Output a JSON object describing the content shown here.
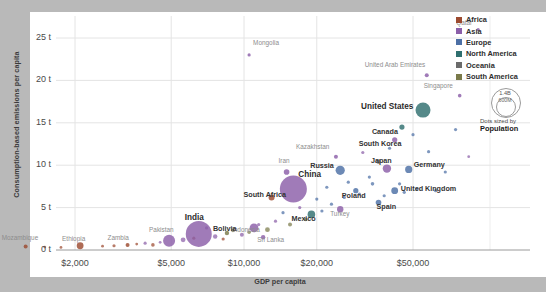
{
  "chart_data": {
    "type": "scatter",
    "title": "",
    "xlabel": "GDP per capita",
    "ylabel": "Consumption-based emissions per capita",
    "xscale": "log",
    "xticks": [
      "$2,000",
      "$5,000",
      "$10,000",
      "$20,000",
      "$50,000"
    ],
    "xtick_values": [
      2000,
      5000,
      10000,
      20000,
      50000
    ],
    "yticks": [
      "0 t",
      "5 t",
      "10 t",
      "15 t",
      "20 t",
      "25 t"
    ],
    "ytick_values": [
      0,
      5,
      10,
      15,
      20,
      25
    ],
    "ylim": [
      0,
      27
    ],
    "grid": true,
    "legend_position": "top-right",
    "size_encoding": "Population",
    "points": [
      {
        "name": "Qatar",
        "x": 93000,
        "y": 26.0,
        "region": "Asia",
        "r": 1.6,
        "label": true,
        "dim": true
      },
      {
        "name": "Mongolia",
        "x": 10500,
        "y": 23.0,
        "region": "Asia",
        "r": 1.6,
        "label": true,
        "dim": true
      },
      {
        "name": "United Arab Emirates",
        "x": 57000,
        "y": 20.6,
        "region": "Asia",
        "r": 2.0,
        "label": true,
        "dim": true
      },
      {
        "name": "Singapore",
        "x": 78000,
        "y": 18.2,
        "region": "Asia",
        "r": 1.8,
        "label": true,
        "dim": true
      },
      {
        "name": "United States",
        "x": 55000,
        "y": 16.5,
        "region": "North America",
        "r": 7.5,
        "label": true,
        "big": true
      },
      {
        "name": "Canada",
        "x": 45000,
        "y": 14.5,
        "region": "North America",
        "r": 2.6,
        "label": true,
        "med": true
      },
      {
        "name": "South Korea",
        "x": 42000,
        "y": 13.0,
        "region": "Asia",
        "r": 2.6,
        "label": true,
        "med": true
      },
      {
        "name": "Kazakhstan",
        "x": 24000,
        "y": 11.0,
        "region": "Asia",
        "r": 2.0,
        "label": true,
        "dim": true
      },
      {
        "name": "Russia",
        "x": 25000,
        "y": 9.4,
        "region": "Europe",
        "r": 4.6,
        "label": true,
        "med": true
      },
      {
        "name": "Japan",
        "x": 39000,
        "y": 9.6,
        "region": "Asia",
        "r": 4.2,
        "label": true,
        "med": true
      },
      {
        "name": "Germany",
        "x": 48000,
        "y": 9.5,
        "region": "Europe",
        "r": 3.6,
        "label": true,
        "med": true
      },
      {
        "name": "Iran",
        "x": 15000,
        "y": 9.2,
        "region": "Asia",
        "r": 2.8,
        "label": true,
        "dim": true
      },
      {
        "name": "China",
        "x": 16000,
        "y": 7.2,
        "region": "Asia",
        "r": 13.5,
        "label": true,
        "big": true
      },
      {
        "name": "Poland",
        "x": 29000,
        "y": 7.0,
        "region": "Europe",
        "r": 2.6,
        "label": true,
        "med": true
      },
      {
        "name": "United Kingdom",
        "x": 42000,
        "y": 7.0,
        "region": "Europe",
        "r": 3.4,
        "label": true,
        "med": true
      },
      {
        "name": "South Africa",
        "x": 13000,
        "y": 6.2,
        "region": "Africa",
        "r": 3.0,
        "label": true,
        "med": true
      },
      {
        "name": "Spain",
        "x": 36000,
        "y": 5.6,
        "region": "Europe",
        "r": 2.8,
        "label": true,
        "med": true
      },
      {
        "name": "Turkey",
        "x": 25000,
        "y": 4.8,
        "region": "Asia",
        "r": 3.2,
        "label": true,
        "dim": true
      },
      {
        "name": "Mexico",
        "x": 19000,
        "y": 4.2,
        "region": "North America",
        "r": 3.8,
        "label": true,
        "med": true
      },
      {
        "name": "Indonesia",
        "x": 11000,
        "y": 2.6,
        "region": "Asia",
        "r": 4.4,
        "label": true,
        "dim": true
      },
      {
        "name": "India",
        "x": 6500,
        "y": 1.9,
        "region": "Asia",
        "r": 13.0,
        "label": true,
        "big": true
      },
      {
        "name": "Bolivia",
        "x": 8500,
        "y": 2.0,
        "region": "South America",
        "r": 2.2,
        "label": true,
        "med": true
      },
      {
        "name": "Sri Lanka",
        "x": 12000,
        "y": 1.5,
        "region": "Asia",
        "r": 2.2,
        "label": true,
        "dim": true
      },
      {
        "name": "Pakistan",
        "x": 4900,
        "y": 1.1,
        "region": "Asia",
        "r": 6.0,
        "label": true,
        "dim": true
      },
      {
        "name": "Zambia",
        "x": 3300,
        "y": 0.6,
        "region": "Africa",
        "r": 2.0,
        "label": true,
        "dim": true
      },
      {
        "name": "Ethiopia",
        "x": 2100,
        "y": 0.5,
        "region": "Africa",
        "r": 3.4,
        "label": true,
        "dim": true
      },
      {
        "name": "Mozambique",
        "x": 1250,
        "y": 0.4,
        "region": "Africa",
        "r": 2.0,
        "label": true,
        "dim": true
      }
    ],
    "unlabeled_points": [
      {
        "x": 1500,
        "y": 0.35,
        "region": "Africa",
        "r": 1.4
      },
      {
        "x": 1750,
        "y": 0.3,
        "region": "Africa",
        "r": 1.4
      },
      {
        "x": 2600,
        "y": 0.45,
        "region": "Africa",
        "r": 1.4
      },
      {
        "x": 2900,
        "y": 0.5,
        "region": "Africa",
        "r": 1.6
      },
      {
        "x": 3600,
        "y": 0.7,
        "region": "Africa",
        "r": 1.4
      },
      {
        "x": 3900,
        "y": 0.8,
        "region": "Asia",
        "r": 1.6
      },
      {
        "x": 4200,
        "y": 0.6,
        "region": "Africa",
        "r": 1.8
      },
      {
        "x": 4500,
        "y": 0.9,
        "region": "Asia",
        "r": 1.4
      },
      {
        "x": 5600,
        "y": 1.2,
        "region": "Asia",
        "r": 2.4
      },
      {
        "x": 6200,
        "y": 1.4,
        "region": "Africa",
        "r": 1.6
      },
      {
        "x": 7000,
        "y": 2.6,
        "region": "Asia",
        "r": 1.6
      },
      {
        "x": 7600,
        "y": 1.6,
        "region": "Asia",
        "r": 2.2
      },
      {
        "x": 8200,
        "y": 1.3,
        "region": "Africa",
        "r": 1.6
      },
      {
        "x": 9000,
        "y": 2.3,
        "region": "South America",
        "r": 1.8
      },
      {
        "x": 9800,
        "y": 1.8,
        "region": "Asia",
        "r": 2.0
      },
      {
        "x": 10500,
        "y": 2.1,
        "region": "South America",
        "r": 1.8
      },
      {
        "x": 11500,
        "y": 3.0,
        "region": "Asia",
        "r": 1.6
      },
      {
        "x": 12500,
        "y": 2.4,
        "region": "South America",
        "r": 2.4
      },
      {
        "x": 13500,
        "y": 3.4,
        "region": "Asia",
        "r": 1.6
      },
      {
        "x": 14500,
        "y": 4.4,
        "region": "Europe",
        "r": 1.6
      },
      {
        "x": 15500,
        "y": 3.0,
        "region": "South America",
        "r": 2.0
      },
      {
        "x": 17000,
        "y": 5.0,
        "region": "Asia",
        "r": 1.6
      },
      {
        "x": 18000,
        "y": 3.6,
        "region": "South America",
        "r": 1.8
      },
      {
        "x": 20000,
        "y": 6.0,
        "region": "Europe",
        "r": 1.6
      },
      {
        "x": 21000,
        "y": 4.6,
        "region": "Europe",
        "r": 1.6
      },
      {
        "x": 22000,
        "y": 7.4,
        "region": "Europe",
        "r": 1.6
      },
      {
        "x": 23000,
        "y": 5.4,
        "region": "Europe",
        "r": 1.6
      },
      {
        "x": 26000,
        "y": 6.2,
        "region": "Europe",
        "r": 1.6
      },
      {
        "x": 27000,
        "y": 8.0,
        "region": "Europe",
        "r": 1.6
      },
      {
        "x": 30000,
        "y": 6.6,
        "region": "Europe",
        "r": 1.6
      },
      {
        "x": 31000,
        "y": 11.5,
        "region": "Asia",
        "r": 1.6
      },
      {
        "x": 33000,
        "y": 8.6,
        "region": "Europe",
        "r": 1.6
      },
      {
        "x": 34000,
        "y": 7.8,
        "region": "Europe",
        "r": 1.8
      },
      {
        "x": 36000,
        "y": 10.4,
        "region": "Oceania",
        "r": 2.2
      },
      {
        "x": 38000,
        "y": 6.4,
        "region": "Europe",
        "r": 1.6
      },
      {
        "x": 40000,
        "y": 12.0,
        "region": "Europe",
        "r": 1.6
      },
      {
        "x": 44000,
        "y": 7.8,
        "region": "Europe",
        "r": 1.6
      },
      {
        "x": 46000,
        "y": 6.8,
        "region": "Europe",
        "r": 1.6
      },
      {
        "x": 50000,
        "y": 13.6,
        "region": "Europe",
        "r": 1.6
      },
      {
        "x": 52000,
        "y": 7.2,
        "region": "Europe",
        "r": 1.6
      },
      {
        "x": 58000,
        "y": 11.6,
        "region": "Europe",
        "r": 1.6
      },
      {
        "x": 62000,
        "y": 7.0,
        "region": "Europe",
        "r": 1.6
      },
      {
        "x": 68000,
        "y": 9.2,
        "region": "Europe",
        "r": 1.6
      },
      {
        "x": 75000,
        "y": 14.2,
        "region": "Europe",
        "r": 1.6
      },
      {
        "x": 85000,
        "y": 11.0,
        "region": "Asia",
        "r": 1.4
      }
    ]
  },
  "legend": {
    "items": [
      {
        "label": "Africa",
        "color": "#9c4a2f"
      },
      {
        "label": "Asia",
        "color": "#8b5ea8"
      },
      {
        "label": "Europe",
        "color": "#4c6fa5"
      },
      {
        "label": "North America",
        "color": "#2f6f6f"
      },
      {
        "label": "Oceania",
        "color": "#6b6b6b"
      },
      {
        "label": "South America",
        "color": "#7a7a4a"
      }
    ]
  },
  "size_legend": {
    "outer_label": "1.4B",
    "inner_label": "600M",
    "caption_line1": "Dots sized by",
    "caption_line2": "Population"
  }
}
